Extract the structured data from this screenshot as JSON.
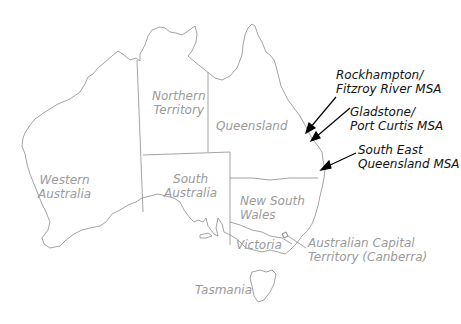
{
  "map": {
    "title": "Australia states and territories with Queensland MSAs",
    "regions": [
      {
        "id": "wa",
        "line1": "Western",
        "line2": "Australia"
      },
      {
        "id": "nt",
        "line1": "Northern",
        "line2": "Territory"
      },
      {
        "id": "qld",
        "line1": "Queensland",
        "line2": ""
      },
      {
        "id": "sa",
        "line1": "South",
        "line2": "Australia"
      },
      {
        "id": "nsw",
        "line1": "New South",
        "line2": "Wales"
      },
      {
        "id": "vic",
        "line1": "Victoria",
        "line2": ""
      },
      {
        "id": "tas",
        "line1": "Tasmania",
        "line2": ""
      },
      {
        "id": "act",
        "line1": "Australian Capital",
        "line2": "Territory (Canberra)"
      }
    ],
    "annotations": [
      {
        "id": "rockhampton",
        "line1": "Rockhampton/",
        "line2": "Fitzroy River MSA"
      },
      {
        "id": "gladstone",
        "line1": "Gladstone/",
        "line2": "Port Curtis MSA"
      },
      {
        "id": "seq",
        "line1": "South East",
        "line2": "Queensland MSA"
      }
    ],
    "colors": {
      "outline": "#8c8c8c",
      "label": "#9a9a9a",
      "annotation": "#111111",
      "arrow": "#000000",
      "background": "#ffffff"
    }
  }
}
